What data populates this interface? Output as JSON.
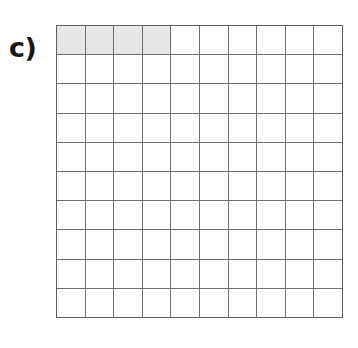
{
  "figure": {
    "label": "c)",
    "type": "hundred-square-grid",
    "rows": 10,
    "columns": 10,
    "total_cells": 100,
    "shaded_cells": 4,
    "fraction_shaded": "4/100",
    "shaded_positions": [
      {
        "row": 1,
        "column": 1
      },
      {
        "row": 1,
        "column": 2
      },
      {
        "row": 1,
        "column": 3
      },
      {
        "row": 1,
        "column": 4
      }
    ],
    "colors": {
      "background": "#ffffff",
      "shaded_fill": "#e7e7e7",
      "empty_fill": "#ffffff",
      "grid_line": "#6e6e6e",
      "outer_frame": "#5f5f5f",
      "label_text": "#171717"
    }
  }
}
